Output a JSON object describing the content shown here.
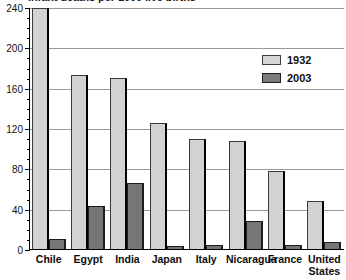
{
  "chart_data": {
    "type": "bar",
    "title": "Infant deaths per 1000 live births",
    "xlabel": "",
    "ylabel": "",
    "ylim": [
      0,
      240
    ],
    "yticks": [
      0,
      40,
      80,
      120,
      160,
      200,
      240
    ],
    "ytick_labels": [
      "0",
      "40",
      "80",
      "120",
      "160",
      "200",
      "240"
    ],
    "minor_tick_step": 10,
    "grid": true,
    "grid_axis": "y",
    "legend_position": "upper right",
    "categories": [
      "Chile",
      "Egypt",
      "India",
      "Japan",
      "Italy",
      "Nicaragua",
      "France",
      "United\nStates"
    ],
    "series": [
      {
        "name": "1932",
        "color": "#d2d2d2",
        "values": [
          239,
          173,
          170,
          125,
          109,
          107,
          77,
          48
        ]
      },
      {
        "name": "2003",
        "color": "#767676",
        "values": [
          10,
          43,
          65,
          3,
          4,
          28,
          4,
          7
        ]
      }
    ]
  },
  "legend": {
    "items": [
      {
        "label": "1932",
        "swatch": "light-gray-swatch"
      },
      {
        "label": "2003",
        "swatch": "dark-gray-swatch"
      }
    ]
  }
}
